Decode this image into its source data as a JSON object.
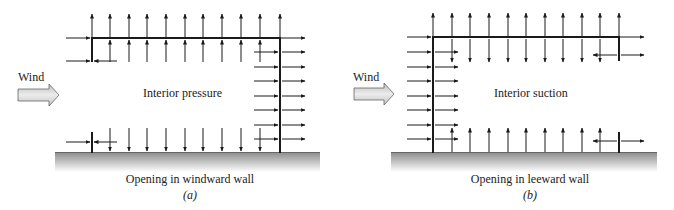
{
  "panels": [
    {
      "id": "a",
      "wind_label": "Wind",
      "interior_label": "Interior pressure",
      "caption": "Opening in windward wall",
      "sublabel": "(a)"
    },
    {
      "id": "b",
      "wind_label": "Wind",
      "interior_label": "Interior suction",
      "caption": "Opening in leeward wall",
      "sublabel": "(b)"
    }
  ],
  "colors": {
    "line": "#1a1a1a",
    "ground_top": "#8a8a8a",
    "ground_bottom": "#ffffff",
    "wind_arrow_fill": "#d4d4d4",
    "wind_arrow_stroke": "#555555"
  }
}
